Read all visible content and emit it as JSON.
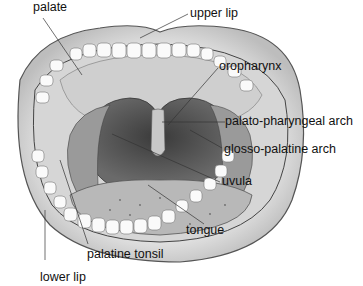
{
  "figure": {
    "labels": {
      "palate": "palate",
      "upper_lip": "upper lip",
      "oropharynx": "oropharynx",
      "palato_pharyngeal_arch": "palato-pharyngeal arch",
      "glosso_palatine_arch": "glosso-palatine arch",
      "uvula": "uvula",
      "tongue": "tongue",
      "palatine_tonsil": "palatine tonsil",
      "lower_lip": "lower lip"
    }
  }
}
